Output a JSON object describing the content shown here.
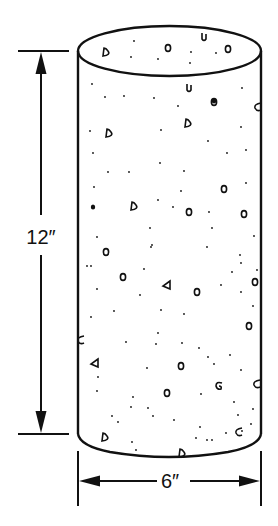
{
  "figure": {
    "height_label": "12″",
    "diameter_label": "6″",
    "stroke_color": "#111111",
    "background_color": "#ffffff"
  },
  "geometry": {
    "cylinder": {
      "left_x": 78,
      "right_x": 261,
      "top_center_y": 51,
      "top_ry": 25,
      "bottom_side_y": 434,
      "bottom_curve_y": 458
    },
    "height_dimension": {
      "x": 41,
      "top_y": 51,
      "bottom_y": 434,
      "tick_x1": 18,
      "tick_x2": 69,
      "label_y": 237
    },
    "diameter_dimension": {
      "y": 481,
      "left_x": 78,
      "right_x": 261,
      "tick_y1": 451,
      "tick_y2": 506,
      "label_x": 169
    }
  },
  "aggregate": {
    "pebbles": [
      [
        106,
        52,
        "d"
      ],
      [
        168,
        48,
        "o"
      ],
      [
        204,
        37,
        "u"
      ],
      [
        228,
        49,
        "o"
      ],
      [
        189,
        88,
        "u"
      ],
      [
        214,
        102,
        "o"
      ],
      [
        258,
        107,
        "c"
      ],
      [
        188,
        123,
        "d"
      ],
      [
        109,
        133,
        "d"
      ],
      [
        224,
        189,
        "o"
      ],
      [
        134,
        206,
        "d"
      ],
      [
        189,
        212,
        "o"
      ],
      [
        244,
        214,
        "o"
      ],
      [
        106,
        252,
        "o"
      ],
      [
        123,
        277,
        "o"
      ],
      [
        167,
        285,
        "t"
      ],
      [
        197,
        292,
        "o"
      ],
      [
        255,
        282,
        "o"
      ],
      [
        249,
        326,
        "o"
      ],
      [
        81,
        340,
        "c"
      ],
      [
        95,
        363,
        "t"
      ],
      [
        181,
        366,
        "o"
      ],
      [
        219,
        386,
        "s"
      ],
      [
        257,
        384,
        "c"
      ],
      [
        167,
        393,
        "o"
      ],
      [
        105,
        437,
        "d"
      ],
      [
        239,
        432,
        "c"
      ],
      [
        182,
        453,
        "d"
      ]
    ],
    "dots": [
      [
        134,
        41
      ],
      [
        131,
        57
      ],
      [
        158,
        59
      ],
      [
        191,
        52
      ],
      [
        190,
        63
      ],
      [
        216,
        53
      ],
      [
        92,
        84
      ],
      [
        105,
        97
      ],
      [
        124,
        96
      ],
      [
        154,
        98
      ],
      [
        178,
        106
      ],
      [
        242,
        88
      ],
      [
        90,
        131
      ],
      [
        161,
        130
      ],
      [
        208,
        141
      ],
      [
        241,
        127
      ],
      [
        93,
        153
      ],
      [
        160,
        163
      ],
      [
        227,
        153
      ],
      [
        246,
        150
      ],
      [
        108,
        172
      ],
      [
        129,
        172
      ],
      [
        184,
        171
      ],
      [
        94,
        187
      ],
      [
        181,
        191
      ],
      [
        246,
        183
      ],
      [
        93,
        207
      ],
      [
        158,
        200
      ],
      [
        173,
        207
      ],
      [
        209,
        212
      ],
      [
        212,
        228
      ],
      [
        150,
        228
      ],
      [
        97,
        237
      ],
      [
        152,
        245
      ],
      [
        254,
        236
      ],
      [
        87,
        266
      ],
      [
        151,
        247
      ],
      [
        207,
        247
      ],
      [
        240,
        255
      ],
      [
        91,
        266
      ],
      [
        144,
        269
      ],
      [
        232,
        272
      ],
      [
        241,
        263
      ],
      [
        257,
        270
      ],
      [
        97,
        289
      ],
      [
        140,
        295
      ],
      [
        221,
        285
      ],
      [
        241,
        292
      ],
      [
        91,
        317
      ],
      [
        114,
        311
      ],
      [
        161,
        310
      ],
      [
        184,
        314
      ],
      [
        253,
        306
      ],
      [
        158,
        333
      ],
      [
        126,
        342
      ],
      [
        156,
        344
      ],
      [
        182,
        343
      ],
      [
        199,
        348
      ],
      [
        208,
        357
      ],
      [
        230,
        355
      ],
      [
        214,
        364
      ],
      [
        147,
        368
      ],
      [
        98,
        377
      ],
      [
        241,
        370
      ],
      [
        97,
        391
      ],
      [
        133,
        397
      ],
      [
        201,
        394
      ],
      [
        234,
        402
      ],
      [
        131,
        407
      ],
      [
        148,
        408
      ],
      [
        153,
        416
      ],
      [
        174,
        420
      ],
      [
        112,
        416
      ],
      [
        118,
        422
      ],
      [
        238,
        415
      ],
      [
        253,
        409
      ],
      [
        251,
        424
      ],
      [
        200,
        427
      ],
      [
        207,
        440
      ],
      [
        212,
        440
      ],
      [
        196,
        438
      ],
      [
        132,
        442
      ],
      [
        136,
        450
      ],
      [
        226,
        433
      ],
      [
        242,
        431
      ]
    ],
    "big_dots": [
      [
        93,
        207
      ],
      [
        214,
        101
      ]
    ]
  }
}
